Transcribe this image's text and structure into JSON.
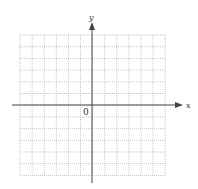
{
  "diagram": {
    "type": "coordinate_plane",
    "x_axis_label": "x",
    "y_axis_label": "y",
    "origin_label": "0",
    "grid": {
      "columns": 12,
      "rows": 12,
      "style": "dotted",
      "left": 20,
      "top": 35,
      "cell_w": 12.1,
      "cell_h": 11.7
    },
    "origin_px": {
      "x": 92,
      "y": 105
    },
    "colors": {
      "grid": "#b8b8b8",
      "axis": "#444444",
      "label": "#333333",
      "background": "#ffffff"
    }
  }
}
